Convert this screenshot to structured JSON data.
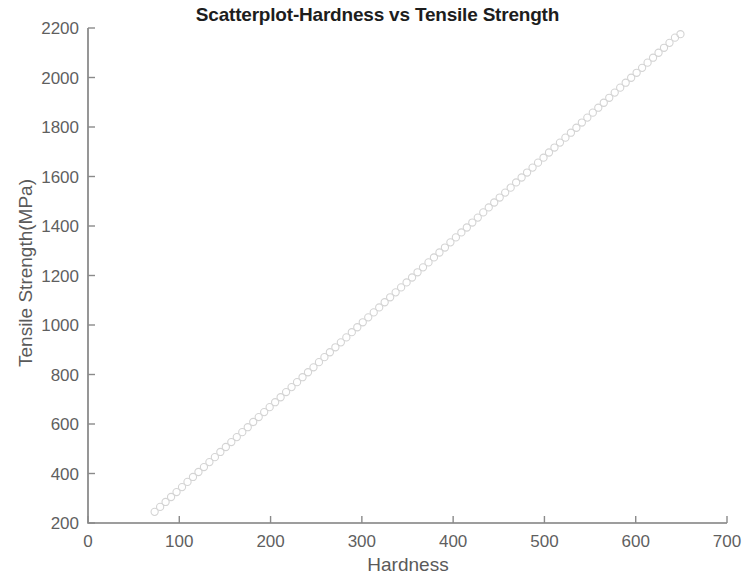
{
  "chart_data": {
    "type": "scatter",
    "title": "Scatterplot-Hardness vs Tensile Strength",
    "xlabel": "Hardness",
    "ylabel": "Tensile Strength(MPa)",
    "xlim": [
      0,
      700
    ],
    "ylim": [
      200,
      2200
    ],
    "xticks": [
      0,
      100,
      200,
      300,
      400,
      500,
      600,
      700
    ],
    "yticks": [
      200,
      400,
      600,
      800,
      1000,
      1200,
      1400,
      1600,
      1800,
      2000,
      2200
    ],
    "xtick_labels": [
      "0",
      "100",
      "200",
      "300",
      "400",
      "500",
      "600",
      "700"
    ],
    "ytick_labels": [
      "200",
      "400",
      "600",
      "800",
      "1000",
      "1200",
      "1400",
      "1600",
      "1800",
      "2000",
      "2200"
    ],
    "grid": false,
    "legend": null,
    "marker": {
      "shape": "open-circle",
      "radius_px": 3.6,
      "stroke_color": "#d4d4d4",
      "fill": "none"
    },
    "axis_color": "#7d7d7d",
    "title_color": "#1d1d1d",
    "label_color": "#5a5a5a",
    "series": [
      {
        "name": "Hardness vs Tensile Strength",
        "x": [
          73,
          79,
          85,
          91,
          97,
          103,
          109,
          115,
          121,
          127,
          133,
          139,
          145,
          151,
          157,
          163,
          169,
          175,
          181,
          187,
          193,
          199,
          205,
          211,
          217,
          223,
          229,
          235,
          241,
          247,
          253,
          259,
          265,
          271,
          277,
          283,
          289,
          295,
          301,
          307,
          313,
          319,
          325,
          331,
          337,
          343,
          349,
          355,
          361,
          367,
          373,
          379,
          385,
          391,
          397,
          403,
          409,
          415,
          421,
          427,
          433,
          439,
          445,
          451,
          457,
          463,
          469,
          475,
          481,
          487,
          493,
          499,
          505,
          511,
          517,
          523,
          529,
          535,
          541,
          547,
          553,
          559,
          565,
          571,
          577,
          583,
          589,
          595,
          601,
          607,
          613,
          619,
          625,
          631,
          637,
          643,
          649
        ],
        "y": [
          245,
          265,
          285,
          305,
          325,
          345,
          366,
          386,
          406,
          426,
          446,
          466,
          487,
          507,
          527,
          547,
          567,
          587,
          608,
          628,
          648,
          668,
          688,
          708,
          729,
          749,
          769,
          789,
          809,
          829,
          850,
          870,
          890,
          910,
          930,
          950,
          971,
          991,
          1011,
          1031,
          1051,
          1071,
          1092,
          1112,
          1132,
          1152,
          1172,
          1192,
          1213,
          1233,
          1253,
          1273,
          1293,
          1313,
          1334,
          1354,
          1374,
          1394,
          1414,
          1434,
          1455,
          1475,
          1495,
          1515,
          1535,
          1555,
          1576,
          1596,
          1616,
          1636,
          1656,
          1676,
          1697,
          1717,
          1737,
          1757,
          1777,
          1797,
          1818,
          1838,
          1858,
          1878,
          1898,
          1918,
          1939,
          1959,
          1979,
          1999,
          2019,
          2039,
          2060,
          2080,
          2100,
          2120,
          2140,
          2161,
          2175
        ]
      }
    ]
  }
}
